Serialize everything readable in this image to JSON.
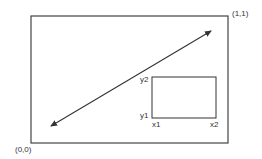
{
  "diagram": {
    "title": "",
    "colors": {
      "stroke": "#333333",
      "background": "#ffffff",
      "text": "#333333"
    },
    "outer_rect": {
      "x": 31,
      "y": 16,
      "w": 197,
      "h": 127
    },
    "corner_labels": {
      "bottom_left": "(0,0)",
      "top_right": "(1,1)"
    },
    "arrow": {
      "x1": 49,
      "y1": 127,
      "x2": 213,
      "y2": 30,
      "double_headed": true
    },
    "inner_rect": {
      "x": 152,
      "y": 77,
      "w": 64,
      "h": 41,
      "labels": {
        "y2": "y2",
        "y1": "y1",
        "x1": "x1",
        "x2": "x2"
      }
    }
  }
}
